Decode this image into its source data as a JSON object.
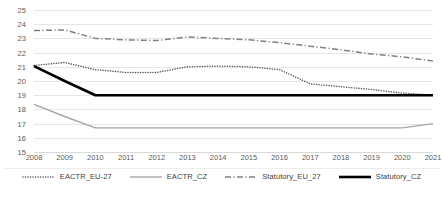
{
  "chart_data": {
    "type": "line",
    "title": "",
    "subtitle": "",
    "xlabel": "",
    "ylabel": "",
    "x": [
      2008,
      2009,
      2010,
      2011,
      2012,
      2013,
      2014,
      2015,
      2016,
      2017,
      2018,
      2019,
      2020,
      2021
    ],
    "categories": [
      "2008",
      "2009",
      "2010",
      "2011",
      "2012",
      "2013",
      "2014",
      "2015",
      "2016",
      "2017",
      "2018",
      "2019",
      "2020",
      "2021"
    ],
    "ylim": [
      15,
      25
    ],
    "xlim": [
      2008,
      2021
    ],
    "yticks": [
      15,
      16,
      17,
      18,
      19,
      20,
      21,
      22,
      23,
      24,
      25
    ],
    "ytick_labels": [
      "15",
      "16",
      "17",
      "18",
      "19",
      "20",
      "21",
      "22",
      "23",
      "24",
      "25"
    ],
    "grid": true,
    "grid_axis": "y",
    "legend_position": "bottom",
    "series": [
      {
        "name": "EACTR_EU-27",
        "style": "dotted",
        "color": "#595959",
        "width": 1.5,
        "values": [
          21.1,
          21.3,
          20.8,
          20.6,
          20.6,
          21.0,
          21.05,
          21.0,
          20.8,
          19.8,
          19.6,
          19.4,
          19.15,
          19.0
        ]
      },
      {
        "name": "EACTR_CZ",
        "style": "solid",
        "color": "#a6a6a6",
        "width": 1.4,
        "values": [
          18.35,
          17.5,
          16.7,
          16.7,
          16.7,
          16.7,
          16.7,
          16.7,
          16.7,
          16.7,
          16.7,
          16.7,
          16.7,
          17.0
        ]
      },
      {
        "name": "Statutory_EU_27",
        "style": "dashdot",
        "color": "#808080",
        "width": 1.5,
        "values": [
          23.55,
          23.6,
          23.0,
          22.9,
          22.85,
          23.1,
          23.0,
          22.9,
          22.7,
          22.45,
          22.2,
          21.9,
          21.7,
          21.4
        ]
      },
      {
        "name": "Statutory_CZ",
        "style": "solid",
        "color": "#000000",
        "width": 2.6,
        "values": [
          21.05,
          20.0,
          19.0,
          19.0,
          19.0,
          19.0,
          19.0,
          19.0,
          19.0,
          19.0,
          19.0,
          19.0,
          19.0,
          19.0
        ]
      }
    ]
  },
  "colors": {
    "gridline": "#e6e6e6",
    "axis_text": "#5a5a5a",
    "legend_text": "#404040",
    "background": "#ffffff"
  }
}
